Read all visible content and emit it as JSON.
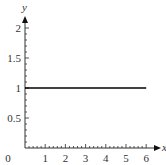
{
  "chart_data": {
    "type": "line",
    "title": "",
    "xlabel": "x",
    "ylabel": "y",
    "xlim": [
      0,
      6
    ],
    "ylim": [
      0,
      2
    ],
    "x_ticks": [
      "0",
      "1",
      "2",
      "3",
      "4",
      "5",
      "6"
    ],
    "y_ticks": [
      "0.5",
      "1",
      "1.5",
      "2"
    ],
    "grid": false,
    "legend": null,
    "series": [
      {
        "name": "y = 1",
        "x": [
          0,
          6
        ],
        "y": [
          1,
          1
        ],
        "color": "#000000"
      }
    ]
  },
  "axes": {
    "x_label": "x",
    "y_label": "y",
    "origin_label": "0"
  }
}
